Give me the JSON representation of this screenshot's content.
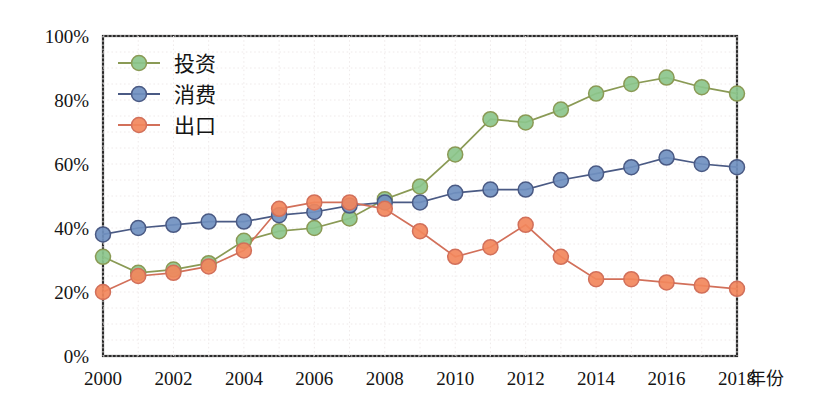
{
  "chart_data": {
    "type": "line",
    "title": "",
    "xlabel": "年份",
    "ylabel": "",
    "x": [
      2000,
      2001,
      2002,
      2003,
      2004,
      2005,
      2006,
      2007,
      2008,
      2009,
      2010,
      2011,
      2012,
      2013,
      2014,
      2015,
      2016,
      2017,
      2018
    ],
    "categories": [
      "2000",
      "2001",
      "2002",
      "2003",
      "2004",
      "2005",
      "2006",
      "2007",
      "2008",
      "2009",
      "2010",
      "2011",
      "2012",
      "2013",
      "2014",
      "2015",
      "2016",
      "2017",
      "2018"
    ],
    "xtick_labels": [
      "2000",
      "2002",
      "2004",
      "2006",
      "2008",
      "2010",
      "2012",
      "2014",
      "2016",
      "2018"
    ],
    "xtick_values": [
      2000,
      2002,
      2004,
      2006,
      2008,
      2010,
      2012,
      2014,
      2016,
      2018
    ],
    "ytick_labels": [
      "0%",
      "20%",
      "40%",
      "60%",
      "80%",
      "100%"
    ],
    "ytick_values": [
      0,
      20,
      40,
      60,
      80,
      100
    ],
    "xlim": [
      2000,
      2018
    ],
    "ylim": [
      0,
      100
    ],
    "grid": true,
    "legend_position": "top-left",
    "series": [
      {
        "name": "投资",
        "color": "#8CC68C",
        "line_color": "#8a9a55",
        "values": [
          31,
          26,
          27,
          29,
          36,
          39,
          40,
          43,
          49,
          53,
          63,
          74,
          73,
          77,
          82,
          85,
          87,
          84,
          82
        ]
      },
      {
        "name": "消费",
        "color": "#7090C0",
        "line_color": "#4a5a84",
        "values": [
          38,
          40,
          41,
          42,
          42,
          44,
          45,
          47,
          48,
          48,
          51,
          52,
          52,
          55,
          57,
          59,
          62,
          60,
          59
        ]
      },
      {
        "name": "出口",
        "color": "#F2875C",
        "line_color": "#d2705a",
        "values": [
          20,
          25,
          26,
          28,
          33,
          46,
          48,
          48,
          46,
          39,
          31,
          34,
          41,
          31,
          24,
          24,
          23,
          22,
          21
        ]
      }
    ]
  },
  "axis": {
    "y_title": "",
    "x_title": "年份"
  },
  "legend": {
    "items": [
      {
        "label": "投资"
      },
      {
        "label": "消费"
      },
      {
        "label": "出口"
      }
    ]
  }
}
